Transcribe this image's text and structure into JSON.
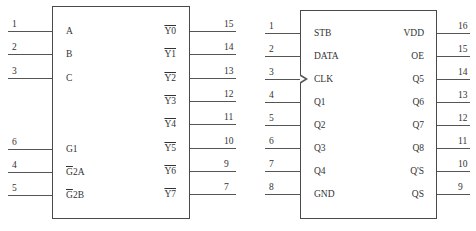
{
  "chips": [
    {
      "name": "decoder-3to8",
      "box": {
        "x": 52,
        "y": 6,
        "w": 138,
        "h": 213
      },
      "left_pins": [
        {
          "num": "1",
          "label": "A",
          "y": 31,
          "overbar": "none"
        },
        {
          "num": "2",
          "label": "B",
          "y": 54,
          "overbar": "none"
        },
        {
          "num": "3",
          "label": "C",
          "y": 78,
          "overbar": "none"
        },
        {
          "num": "6",
          "label": "G1",
          "y": 149,
          "overbar": "none"
        },
        {
          "num": "4",
          "label": "G2A",
          "label_bar": "G",
          "label_rest": "2A",
          "y": 172,
          "overbar": "partial"
        },
        {
          "num": "5",
          "label": "G2B",
          "label_bar": "G",
          "label_rest": "2B",
          "y": 195,
          "overbar": "partial"
        }
      ],
      "right_pins": [
        {
          "num": "15",
          "label": "Y0",
          "y": 31,
          "overbar": "full"
        },
        {
          "num": "14",
          "label": "Y1",
          "y": 54,
          "overbar": "full"
        },
        {
          "num": "13",
          "label": "Y2",
          "y": 78,
          "overbar": "full"
        },
        {
          "num": "12",
          "label": "Y3",
          "y": 101,
          "overbar": "full"
        },
        {
          "num": "11",
          "label": "Y4",
          "y": 124,
          "overbar": "full"
        },
        {
          "num": "10",
          "label": "Y5",
          "y": 148,
          "overbar": "full"
        },
        {
          "num": "9",
          "label": "Y6",
          "y": 171,
          "overbar": "full"
        },
        {
          "num": "7",
          "label": "Y7",
          "y": 194,
          "overbar": "full"
        }
      ],
      "pin_left_x1": 8,
      "pin_right_x2": 236,
      "label_left_x": 66,
      "label_right_x": 176
    },
    {
      "name": "shift-register-4094",
      "box": {
        "x": 300,
        "y": 10,
        "w": 137,
        "h": 209
      },
      "left_pins": [
        {
          "num": "1",
          "label": "STB",
          "y": 33
        },
        {
          "num": "2",
          "label": "DATA",
          "y": 56
        },
        {
          "num": "3",
          "label": "CLK",
          "y": 79,
          "clock": true
        },
        {
          "num": "4",
          "label": "Q1",
          "y": 102
        },
        {
          "num": "5",
          "label": "Q2",
          "y": 125
        },
        {
          "num": "6",
          "label": "Q3",
          "y": 148
        },
        {
          "num": "7",
          "label": "Q4",
          "y": 171
        },
        {
          "num": "8",
          "label": "GND",
          "y": 194
        }
      ],
      "right_pins": [
        {
          "num": "16",
          "label": "VDD",
          "y": 33
        },
        {
          "num": "15",
          "label": "OE",
          "y": 56
        },
        {
          "num": "14",
          "label": "Q5",
          "y": 79
        },
        {
          "num": "13",
          "label": "Q6",
          "y": 102
        },
        {
          "num": "12",
          "label": "Q7",
          "y": 125
        },
        {
          "num": "11",
          "label": "Q8",
          "y": 148
        },
        {
          "num": "10",
          "label": "Q'S",
          "y": 171
        },
        {
          "num": "9",
          "label": "QS",
          "y": 194
        }
      ],
      "pin_left_x1": 265,
      "pin_right_x2": 470,
      "label_left_x": 314,
      "label_right_x": 424
    }
  ]
}
